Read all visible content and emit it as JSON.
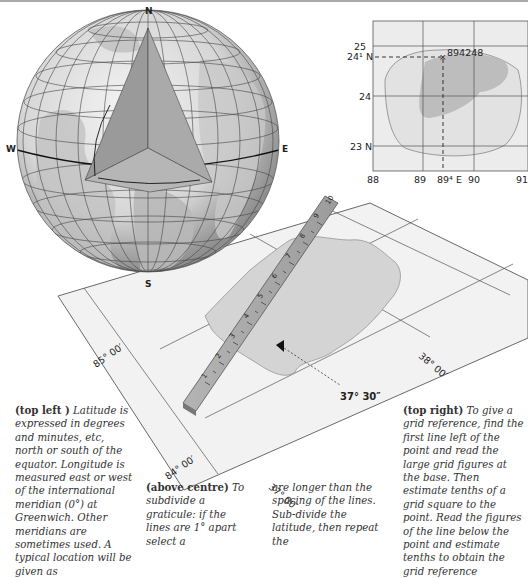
{
  "globe": {
    "labels": {
      "north": "N",
      "south": "S",
      "west": "W",
      "east": "E"
    }
  },
  "grid_map": {
    "y_labels": [
      "25",
      "24¹ N",
      "24",
      "23 N"
    ],
    "x_labels": [
      "88",
      "89",
      "89⁴ E",
      "90",
      "91"
    ],
    "point_label": "894248"
  },
  "graticule": {
    "labels": {
      "lon_85": "85° 00′",
      "lon_84": "84° 00′",
      "lat_37": "37° 00′",
      "lat_38": "38° 00′",
      "reading": "37° 30″"
    },
    "ruler_ticks": [
      "1",
      "2",
      "3",
      "4",
      "5",
      "6",
      "7",
      "8",
      "9",
      "10"
    ]
  },
  "captions": {
    "top_left": {
      "heading": "(top left )",
      "text": " Latitude is expressed in degrees and minutes, etc, north or south of the equator. Longitude is measured east or west of the international meridian (0°) at Green­wich. Other meridians are sometimes used. A typical location will be given as"
    },
    "above_centre": {
      "heading": "(above centre)",
      "text": " To sub­divide a graticule: if the lines are 1° apart select a"
    },
    "centre_cont": {
      "text": "are longer than the spac­ing of the lines. Sub-divide the latitude, then repeat the"
    },
    "top_right": {
      "heading": "(top right)",
      "text": " To give a grid reference, find the first line left of the point and read the large grid figures at the base. Then estimate tenths of a grid square to the point. Read the figures of the line below the point and estimate tenths to obtain the grid reference"
    }
  }
}
